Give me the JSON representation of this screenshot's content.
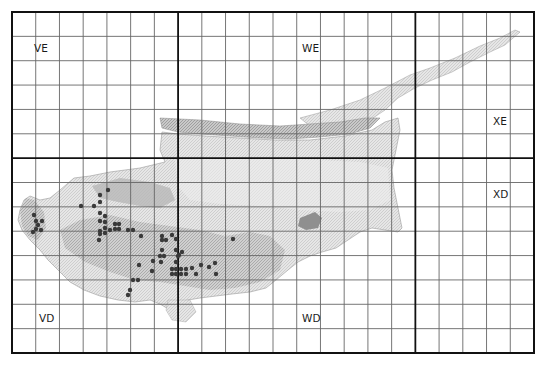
{
  "map": {
    "title": "Cyprus UTM grid distribution map",
    "grid": {
      "left": 12,
      "top": 12,
      "right": 534,
      "bottom": 353,
      "columns": 22,
      "rows": 14,
      "thick_columns": [
        7,
        17
      ],
      "thick_rows": [
        6
      ],
      "line_color": "#666666",
      "thick_line_color": "#111111",
      "border_color": "#111111"
    },
    "squares": [
      {
        "id": "VE",
        "label": "VE",
        "x": 34,
        "y": 52
      },
      {
        "id": "WE",
        "label": "WE",
        "x": 302,
        "y": 52
      },
      {
        "id": "XE",
        "label": "XE",
        "x": 493,
        "y": 125
      },
      {
        "id": "XD",
        "label": "XD",
        "x": 493,
        "y": 198
      },
      {
        "id": "VD",
        "label": "VD",
        "x": 39,
        "y": 322
      },
      {
        "id": "WD",
        "label": "WD",
        "x": 302,
        "y": 322
      }
    ],
    "colors": {
      "land_light": "#e4e4e4",
      "land_mid": "#c6c6c6",
      "land_dark": "#9a9a9a",
      "record_dot": "#3a3a3a"
    },
    "records": [
      [
        34,
        215
      ],
      [
        36,
        221
      ],
      [
        38,
        225
      ],
      [
        41,
        230
      ],
      [
        33,
        232
      ],
      [
        36,
        229
      ],
      [
        42,
        221
      ],
      [
        108,
        190
      ],
      [
        100,
        195
      ],
      [
        100,
        202
      ],
      [
        94,
        206
      ],
      [
        81,
        206
      ],
      [
        100,
        213
      ],
      [
        105,
        216
      ],
      [
        105,
        222
      ],
      [
        100,
        221
      ],
      [
        105,
        228
      ],
      [
        100,
        231
      ],
      [
        115,
        224
      ],
      [
        119,
        224
      ],
      [
        115,
        229
      ],
      [
        119,
        229
      ],
      [
        110,
        230
      ],
      [
        105,
        233
      ],
      [
        100,
        234
      ],
      [
        99,
        240
      ],
      [
        128,
        230
      ],
      [
        133,
        230
      ],
      [
        141,
        236
      ],
      [
        162,
        240
      ],
      [
        166,
        240
      ],
      [
        176,
        239
      ],
      [
        162,
        236
      ],
      [
        172,
        235
      ],
      [
        162,
        250
      ],
      [
        164,
        256
      ],
      [
        161,
        262
      ],
      [
        176,
        250
      ],
      [
        179,
        255
      ],
      [
        182,
        252
      ],
      [
        153,
        261
      ],
      [
        176,
        262
      ],
      [
        139,
        265
      ],
      [
        152,
        271
      ],
      [
        172,
        269
      ],
      [
        176,
        269
      ],
      [
        181,
        269
      ],
      [
        186,
        269
      ],
      [
        172,
        274
      ],
      [
        176,
        274
      ],
      [
        181,
        274
      ],
      [
        186,
        274
      ],
      [
        192,
        268
      ],
      [
        196,
        274
      ],
      [
        201,
        265
      ],
      [
        216,
        274
      ],
      [
        209,
        267
      ],
      [
        215,
        263
      ],
      [
        233,
        239
      ],
      [
        133,
        280
      ],
      [
        138,
        280
      ],
      [
        128,
        295
      ],
      [
        130,
        290
      ],
      [
        160,
        256
      ],
      [
        178,
        256
      ]
    ]
  }
}
